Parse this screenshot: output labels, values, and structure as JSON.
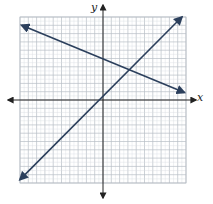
{
  "chart_data": {
    "type": "line",
    "title": "",
    "xlabel": "x",
    "ylabel": "y",
    "xlim": [
      -10,
      10
    ],
    "ylim": [
      -10,
      10
    ],
    "grid": true,
    "grid_step": 1,
    "legend": null,
    "series": [
      {
        "name": "line-positive-slope",
        "equation_estimate": "y = x",
        "points": [
          [
            -10,
            -9.6
          ],
          [
            9.5,
            10
          ]
        ],
        "color": "#2b3f5c",
        "arrows": "both"
      },
      {
        "name": "line-negative-slope",
        "equation_estimate": "y = -0.4x + 5",
        "points": [
          [
            -9.8,
            9
          ],
          [
            9.8,
            0.9
          ]
        ],
        "color": "#2b3f5c",
        "arrows": "both"
      }
    ],
    "intersection_estimate": [
      3.4,
      3.7
    ]
  },
  "colors": {
    "grid_minor": "#d6dbe0",
    "grid_major": "#b8bec6",
    "axis": "#222222",
    "line": "#2b3f5c"
  },
  "labels": {
    "x_axis": "x",
    "y_axis": "y"
  }
}
